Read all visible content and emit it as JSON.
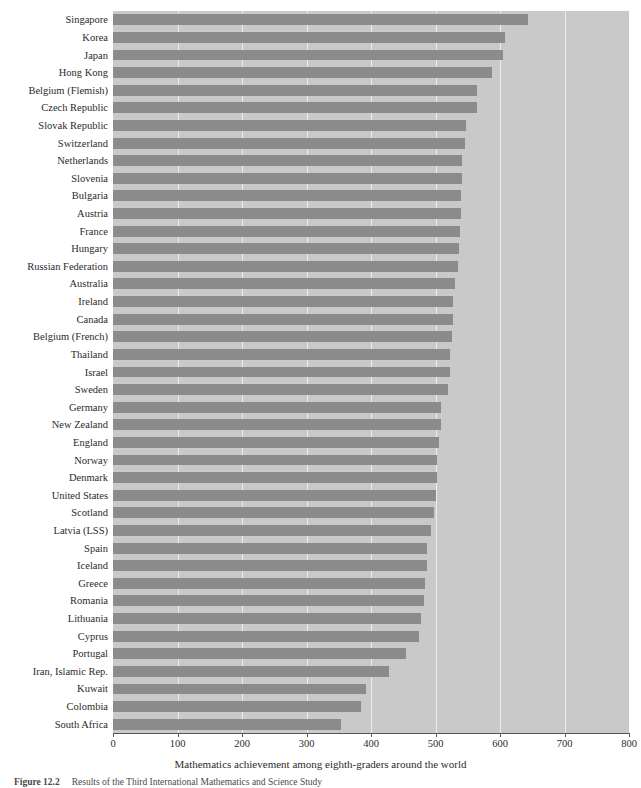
{
  "chart_data": {
    "type": "bar",
    "orientation": "horizontal",
    "title": "",
    "xlabel": "Mathematics achievement among eighth-graders around the world",
    "ylabel": "",
    "xlim": [
      0,
      800
    ],
    "xticks": [
      0,
      100,
      200,
      300,
      400,
      500,
      600,
      700,
      800
    ],
    "xticklabels": [
      "0",
      "100",
      "200",
      "300",
      "400",
      "500",
      "600",
      "700",
      "800"
    ],
    "grid": true,
    "grid_axis": "x",
    "legend": null,
    "categories": [
      "Singapore",
      "Korea",
      "Japan",
      "Hong Kong",
      "Belgium (Flemish)",
      "Czech Republic",
      "Slovak Republic",
      "Switzerland",
      "Netherlands",
      "Slovenia",
      "Bulgaria",
      "Austria",
      "France",
      "Hungary",
      "Russian Federation",
      "Australia",
      "Ireland",
      "Canada",
      "Belgium (French)",
      "Thailand",
      "Israel",
      "Sweden",
      "Germany",
      "New Zealand",
      "England",
      "Norway",
      "Denmark",
      "United States",
      "Scotland",
      "Latvia (LSS)",
      "Spain",
      "Iceland",
      "Greece",
      "Romania",
      "Lithuania",
      "Cyprus",
      "Portugal",
      "Iran, Islamic Rep.",
      "Kuwait",
      "Colombia",
      "South Africa"
    ],
    "values": [
      643,
      607,
      605,
      588,
      565,
      564,
      547,
      545,
      541,
      541,
      540,
      539,
      538,
      537,
      535,
      530,
      527,
      527,
      526,
      522,
      522,
      519,
      509,
      508,
      506,
      503,
      502,
      500,
      498,
      493,
      487,
      487,
      484,
      482,
      477,
      474,
      454,
      428,
      392,
      385,
      354
    ],
    "bar_color": "#8b8b8b",
    "plot_background": "#c9c9c9",
    "gridline_color": "#ededed",
    "page_background": "#ffffff"
  },
  "caption": {
    "label": "Figure 12.2",
    "text": "Results of the Third International Mathematics and Science Study"
  }
}
